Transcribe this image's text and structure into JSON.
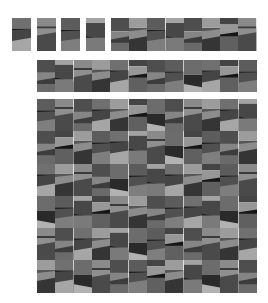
{
  "figure": {
    "background": "#ffffff"
  },
  "patterns": [
    [
      [
        "#707070",
        0.32,
        0.0
      ],
      [
        "#1e1e1e",
        0.05,
        0.04
      ],
      [
        "#454545",
        0.33,
        0.1
      ],
      [
        "#a6a6a6",
        0.3,
        0.0
      ]
    ],
    [
      [
        "#8a8a8a",
        0.25,
        0.0
      ],
      [
        "#3a3a3a",
        0.06,
        0.0
      ],
      [
        "#8f8f8f",
        0.22,
        0.1
      ],
      [
        "#4a4a4a",
        0.47,
        0.0
      ]
    ],
    [
      [
        "#5c5c5c",
        0.35,
        0.0
      ],
      [
        "#1a1a1a",
        0.05,
        0.02
      ],
      [
        "#505050",
        0.3,
        0.08
      ],
      [
        "#7e7e7e",
        0.3,
        0.0
      ]
    ],
    [
      [
        "#a3a3a3",
        0.15,
        0.0
      ],
      [
        "#474747",
        0.4,
        -0.12
      ],
      [
        "#1d1d1d",
        0.05,
        0.0
      ],
      [
        "#7a7a7a",
        0.4,
        0.0
      ]
    ],
    [
      [
        "#4e4e4e",
        0.4,
        0.0
      ],
      [
        "#858585",
        0.25,
        0.1
      ],
      [
        "#3c3c3c",
        0.1,
        0.0
      ],
      [
        "#6a6a6a",
        0.25,
        0.0
      ]
    ],
    [
      [
        "#9c9c9c",
        0.3,
        0.0
      ],
      [
        "#565656",
        0.1,
        0.06
      ],
      [
        "#8c8c8c",
        0.25,
        0.1
      ],
      [
        "#353535",
        0.35,
        0.0
      ]
    ],
    [
      [
        "#6c6c6c",
        0.45,
        0.0
      ],
      [
        "#2a2a2a",
        0.3,
        -0.1
      ],
      [
        "#b2b2b2",
        0.25,
        0.0
      ]
    ],
    [
      [
        "#444444",
        0.2,
        0.0
      ],
      [
        "#979797",
        0.3,
        0.08
      ],
      [
        "#161616",
        0.05,
        0.0
      ],
      [
        "#606060",
        0.45,
        0.0
      ]
    ]
  ],
  "groups": [
    {
      "name": "single-tile-1",
      "x": 12,
      "y": 18,
      "tile_w": 19,
      "tile_h": 33,
      "rows": [
        [
          0
        ]
      ]
    },
    {
      "name": "single-tile-2",
      "x": 37,
      "y": 18,
      "tile_w": 19,
      "tile_h": 33,
      "rows": [
        [
          1
        ]
      ]
    },
    {
      "name": "single-tile-3",
      "x": 61,
      "y": 18,
      "tile_w": 19,
      "tile_h": 33,
      "rows": [
        [
          2
        ]
      ]
    },
    {
      "name": "single-tile-4",
      "x": 86,
      "y": 18,
      "tile_w": 19,
      "tile_h": 33,
      "rows": [
        [
          3
        ]
      ]
    },
    {
      "name": "strip-8",
      "x": 111,
      "y": 18,
      "tile_w": 18.2,
      "tile_h": 33,
      "rows": [
        [
          4,
          5,
          2,
          3,
          4,
          5,
          7,
          1
        ]
      ]
    },
    {
      "name": "strip-12",
      "x": 37,
      "y": 60,
      "tile_w": 18.33,
      "tile_h": 32,
      "rows": [
        [
          4,
          3,
          1,
          5,
          0,
          7,
          4,
          2,
          6,
          0,
          7,
          2
        ]
      ]
    },
    {
      "name": "grid-12x6",
      "x": 37,
      "y": 99,
      "tile_w": 18.33,
      "tile_h": 32.3,
      "rows": [
        [
          2,
          1,
          4,
          0,
          5,
          7,
          6,
          4,
          1,
          5,
          0,
          3
        ],
        [
          4,
          7,
          5,
          2,
          0,
          3,
          1,
          6,
          7,
          2,
          4,
          5
        ],
        [
          0,
          5,
          1,
          4,
          6,
          2,
          3,
          0,
          5,
          7,
          2,
          1
        ],
        [
          6,
          2,
          3,
          7,
          1,
          5,
          4,
          2,
          0,
          3,
          6,
          7
        ],
        [
          1,
          4,
          0,
          5,
          3,
          6,
          2,
          7,
          4,
          1,
          5,
          0
        ],
        [
          5,
          0,
          6,
          1,
          4,
          2,
          7,
          5,
          3,
          6,
          1,
          4
        ]
      ]
    }
  ]
}
